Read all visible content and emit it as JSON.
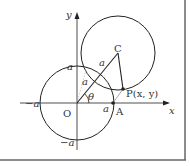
{
  "diagram": {
    "axes": {
      "x_label": "x",
      "y_label": "y"
    },
    "points": {
      "origin": "O",
      "center": "C",
      "point_a": "A",
      "point_p": "P(x, y)"
    },
    "ticks": {
      "pos_x": "a",
      "neg_x": "−a",
      "pos_y": "a",
      "neg_y": "−a"
    },
    "segment_labels": {
      "oc_lower": "a",
      "oc_upper": "a"
    },
    "angle_label": "θ",
    "colors": {
      "stroke": "#222222",
      "light_arc": "#aaaaaa",
      "frame": "#666666"
    }
  }
}
